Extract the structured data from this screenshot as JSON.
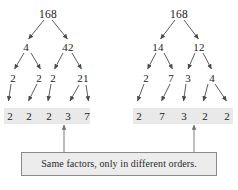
{
  "diagram": {
    "caption": "Same factors, only in different orders.",
    "colors": {
      "leaf_band": "#e9e9e9",
      "caption_fill": "#ececec",
      "caption_border": "#8a8a8a",
      "edge": "#4a4a4a",
      "text": "#1a1a1a"
    },
    "trees": [
      {
        "name": "left-factor-tree",
        "root": "168",
        "levels": [
          {
            "level": 1,
            "nodes": [
              "168"
            ]
          },
          {
            "level": 2,
            "nodes": [
              "4",
              "42"
            ]
          },
          {
            "level": 3,
            "nodes": [
              "2",
              "2",
              "2",
              "21"
            ]
          },
          {
            "level": 4,
            "nodes": [
              "2",
              "2",
              "2",
              "3",
              "7"
            ]
          }
        ],
        "leaves": [
          "2",
          "2",
          "2",
          "3",
          "7"
        ]
      },
      {
        "name": "right-factor-tree",
        "root": "168",
        "levels": [
          {
            "level": 1,
            "nodes": [
              "168"
            ]
          },
          {
            "level": 2,
            "nodes": [
              "14",
              "12"
            ]
          },
          {
            "level": 3,
            "nodes": [
              "2",
              "7",
              "3",
              "4"
            ]
          },
          {
            "level": 4,
            "nodes": [
              "2",
              "7",
              "3",
              "2",
              "2"
            ]
          }
        ],
        "leaves": [
          "2",
          "7",
          "3",
          "2",
          "2"
        ]
      }
    ],
    "left_tree": {
      "root": "168",
      "l2_a": "4",
      "l2_b": "42",
      "l3_a": "2",
      "l3_b": "2",
      "l3_c": "2",
      "l3_d": "21",
      "leaf_1": "2",
      "leaf_2": "2",
      "leaf_3": "2",
      "leaf_4": "3",
      "leaf_5": "7"
    },
    "right_tree": {
      "root": "168",
      "l2_a": "14",
      "l2_b": "12",
      "l3_a": "2",
      "l3_b": "7",
      "l3_c": "3",
      "l3_d": "4",
      "leaf_1": "2",
      "leaf_2": "7",
      "leaf_3": "3",
      "leaf_4": "2",
      "leaf_5": "2"
    }
  }
}
